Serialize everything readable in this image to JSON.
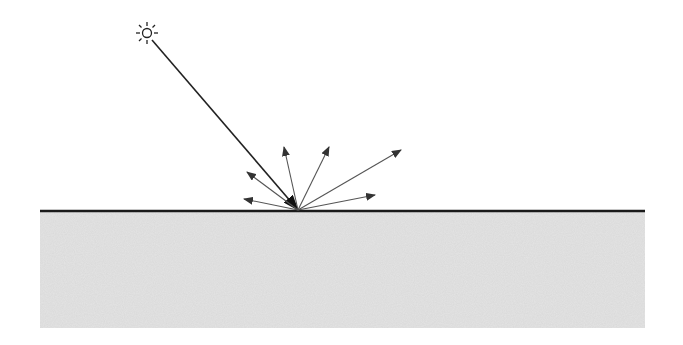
{
  "diagram": {
    "type": "diffuse-reflection",
    "colors": {
      "background": "#ffffff",
      "ink": "#1a1a1a",
      "ray": "#333333",
      "reflected": "#555555",
      "ground": "#e4e4e4",
      "ground_speckle": "#d2d2d2"
    },
    "light_source": {
      "icon": "sun-icon",
      "cx": 147,
      "cy": 33,
      "r": 5
    },
    "surface": {
      "x1": 40,
      "x2": 645,
      "y": 211
    },
    "ground": {
      "x": 40,
      "y": 212,
      "width": 605,
      "height": 116
    },
    "incident_ray": {
      "from": [
        152,
        40
      ],
      "to": [
        298,
        210
      ]
    },
    "hit_point": [
      298,
      210
    ],
    "reflected_rays": [
      {
        "to": [
          244,
          199
        ]
      },
      {
        "to": [
          247,
          172
        ]
      },
      {
        "to": [
          284,
          147
        ]
      },
      {
        "to": [
          329,
          147
        ]
      },
      {
        "to": [
          401,
          150
        ]
      },
      {
        "to": [
          375,
          195
        ]
      }
    ]
  }
}
